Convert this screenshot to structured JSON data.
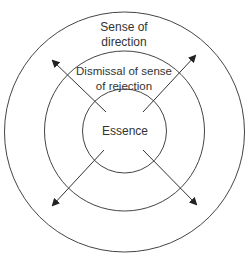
{
  "diagram": {
    "type": "concentric-circles",
    "colors": {
      "stroke": "#444444",
      "text": "#333333",
      "background": "#ffffff"
    },
    "rings": [
      {
        "id": "outer",
        "label_line1": "Sense of",
        "label_line2": "direction"
      },
      {
        "id": "middle",
        "label_line1": "Dismissal of sense",
        "label_line2": "of rejection"
      },
      {
        "id": "inner",
        "label_line1": "Essence"
      }
    ],
    "arrows": [
      {
        "direction": "up-left"
      },
      {
        "direction": "up-right"
      },
      {
        "direction": "down-left"
      },
      {
        "direction": "down-right"
      }
    ]
  }
}
